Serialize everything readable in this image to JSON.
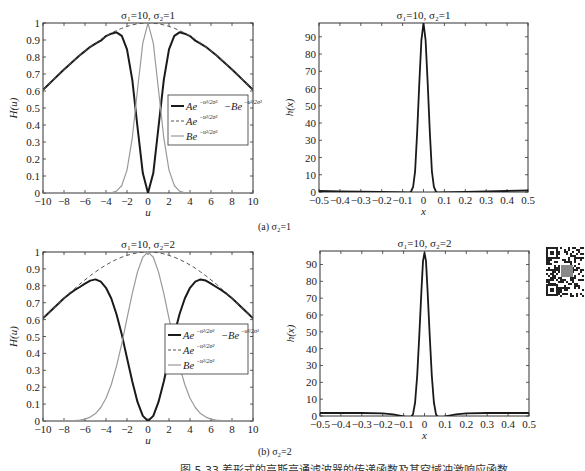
{
  "figure": {
    "caption": "图 5.33   差形式的高斯高通滤波器的传递函数及其空域冲激响应函数",
    "sub_captions": [
      {
        "label": "(a) σ₂=1"
      },
      {
        "label": "(b) σ₂=2"
      }
    ],
    "qr_code": {
      "present": true
    }
  },
  "chart_data": [
    {
      "id": "freq_a",
      "type": "line",
      "title": "σ₁=10, σ₂=1",
      "xlabel": "u",
      "ylabel": "H(u)",
      "xlim": [
        -10,
        10
      ],
      "ylim": [
        0,
        1
      ],
      "xticks": [
        -10,
        -8,
        -6,
        -4,
        -2,
        0,
        2,
        4,
        6,
        8,
        10
      ],
      "xtick_labels": [
        "−10",
        "−8",
        "−6",
        "−4",
        "−2",
        "0",
        "2",
        "4",
        "6",
        "8",
        "10"
      ],
      "yticks": [
        0,
        0.1,
        0.2,
        0.3,
        0.4,
        0.5,
        0.6,
        0.7,
        0.8,
        0.9,
        1
      ],
      "ytick_labels": [
        "0",
        "0.1",
        "0.2",
        "0.3",
        "0.4",
        "0.5",
        "0.6",
        "0.7",
        "0.8",
        "0.9",
        "1"
      ],
      "grid": false,
      "legend": {
        "position": "center-right",
        "entries": [
          "Ae^{-u²/2σ₁²} − Be^{-u²/2σ₂²}",
          "Ae^{-u²/2σ₁²}",
          "Be^{-u²/2σ₂²}"
        ]
      },
      "x": [
        -10,
        -9.5,
        -9,
        -8.5,
        -8,
        -7.5,
        -7,
        -6.5,
        -6,
        -5.5,
        -5,
        -4.5,
        -4,
        -3.5,
        -3,
        -2.5,
        -2,
        -1.5,
        -1,
        -0.5,
        0,
        0.5,
        1,
        1.5,
        2,
        2.5,
        3,
        3.5,
        4,
        4.5,
        5,
        5.5,
        6,
        6.5,
        7,
        7.5,
        8,
        8.5,
        9,
        9.5,
        10
      ],
      "series": [
        {
          "name": "Ae^{-u²/2σ₁²} − Be^{-u²/2σ₂²}",
          "style": "solid",
          "color": "#1a1a1a",
          "width": 2,
          "values": [
            0.607,
            0.637,
            0.667,
            0.697,
            0.726,
            0.755,
            0.783,
            0.81,
            0.835,
            0.86,
            0.879,
            0.896,
            0.923,
            0.937,
            0.945,
            0.925,
            0.845,
            0.665,
            0.388,
            0.117,
            0,
            0.117,
            0.388,
            0.665,
            0.845,
            0.925,
            0.945,
            0.937,
            0.923,
            0.896,
            0.879,
            0.86,
            0.835,
            0.81,
            0.783,
            0.755,
            0.726,
            0.697,
            0.667,
            0.637,
            0.607
          ]
        },
        {
          "name": "Ae^{-u²/2σ₁²}",
          "style": "dashed",
          "color": "#555555",
          "width": 1,
          "values": [
            0.607,
            0.637,
            0.667,
            0.697,
            0.726,
            0.755,
            0.783,
            0.81,
            0.835,
            0.86,
            0.882,
            0.904,
            0.923,
            0.941,
            0.956,
            0.969,
            0.98,
            0.989,
            0.995,
            0.999,
            1,
            0.999,
            0.995,
            0.989,
            0.98,
            0.969,
            0.956,
            0.941,
            0.923,
            0.904,
            0.882,
            0.86,
            0.835,
            0.81,
            0.783,
            0.755,
            0.726,
            0.697,
            0.667,
            0.637,
            0.607
          ]
        },
        {
          "name": "Be^{-u²/2σ₂²}",
          "style": "solid",
          "color": "#9a9a9a",
          "width": 1.2,
          "values": [
            0,
            0,
            0,
            0,
            0,
            0,
            0,
            0,
            0,
            0,
            0,
            0,
            0,
            0.002,
            0.011,
            0.044,
            0.135,
            0.325,
            0.607,
            0.882,
            1,
            0.882,
            0.607,
            0.325,
            0.135,
            0.044,
            0.011,
            0.002,
            0,
            0,
            0,
            0,
            0,
            0,
            0,
            0,
            0,
            0,
            0,
            0,
            0
          ]
        }
      ]
    },
    {
      "id": "spatial_a",
      "type": "line",
      "title": "σ₁=10, σ₂=1",
      "xlabel": "x",
      "ylabel": "h(x)",
      "xlim": [
        -0.5,
        0.5
      ],
      "ylim": [
        0,
        98
      ],
      "xticks": [
        -0.5,
        -0.4,
        -0.3,
        -0.2,
        -0.1,
        0,
        0.1,
        0.2,
        0.3,
        0.4,
        0.5
      ],
      "xtick_labels": [
        "−0.5",
        "−0.4",
        "−0.3",
        "−0.2",
        "−0.1",
        "0",
        "0.1",
        "0.2",
        "0.3",
        "0.4",
        "0.5"
      ],
      "yticks": [
        0,
        10,
        20,
        30,
        40,
        50,
        60,
        70,
        80,
        90
      ],
      "ytick_labels": [
        "0",
        "10",
        "20",
        "30",
        "40",
        "50",
        "60",
        "70",
        "80",
        "90"
      ],
      "grid": false,
      "x": [
        -0.5,
        -0.4,
        -0.3,
        -0.2,
        -0.1,
        -0.07,
        -0.06,
        -0.05,
        -0.04,
        -0.03,
        -0.02,
        -0.01,
        0,
        0.01,
        0.02,
        0.03,
        0.04,
        0.05,
        0.06,
        0.07,
        0.1,
        0.2,
        0.3,
        0.4,
        0.5
      ],
      "series": [
        {
          "name": "h(x)",
          "style": "solid",
          "color": "#1a1a1a",
          "width": 1.8,
          "values": [
            0.6,
            0.4,
            0.2,
            0,
            -0.2,
            -0.4,
            0.2,
            3,
            12,
            35,
            63,
            88,
            98,
            88,
            63,
            35,
            12,
            3,
            0.2,
            -0.4,
            -0.2,
            0,
            0.3,
            0.6,
            1
          ]
        }
      ]
    },
    {
      "id": "freq_b",
      "type": "line",
      "title": "σ₁=10, σ₂=2",
      "xlabel": "u",
      "ylabel": "H(u)",
      "xlim": [
        -10,
        10
      ],
      "ylim": [
        0,
        1
      ],
      "xticks": [
        -10,
        -8,
        -6,
        -4,
        -2,
        0,
        2,
        4,
        6,
        8,
        10
      ],
      "xtick_labels": [
        "−10",
        "−8",
        "−6",
        "−4",
        "−2",
        "0",
        "2",
        "4",
        "6",
        "8",
        "10"
      ],
      "yticks": [
        0,
        0.1,
        0.2,
        0.3,
        0.4,
        0.5,
        0.6,
        0.7,
        0.8,
        0.9,
        1
      ],
      "ytick_labels": [
        "0",
        "0.1",
        "0.2",
        "0.3",
        "0.4",
        "0.5",
        "0.6",
        "0.7",
        "0.8",
        "0.9",
        "1"
      ],
      "grid": false,
      "legend": {
        "position": "center-right",
        "entries": [
          "Ae^{-u²/2σ₁²} − Be^{-u²/2σ₂²}",
          "Ae^{-u²/2σ₁²}",
          "Be^{-u²/2σ₂²}"
        ]
      },
      "x": [
        -10,
        -9.5,
        -9,
        -8.5,
        -8,
        -7.5,
        -7,
        -6.5,
        -6,
        -5.5,
        -5,
        -4.5,
        -4,
        -3.5,
        -3,
        -2.5,
        -2,
        -1.5,
        -1,
        -0.5,
        0,
        0.5,
        1,
        1.5,
        2,
        2.5,
        3,
        3.5,
        4,
        4.5,
        5,
        5.5,
        6,
        6.5,
        7,
        7.5,
        8,
        8.5,
        9,
        9.5,
        10
      ],
      "series": [
        {
          "name": "Ae^{-u²/2σ₁²} − Be^{-u²/2σ₂²}",
          "style": "solid",
          "color": "#1a1a1a",
          "width": 2,
          "values": [
            0.607,
            0.637,
            0.667,
            0.697,
            0.726,
            0.752,
            0.774,
            0.793,
            0.813,
            0.831,
            0.838,
            0.824,
            0.788,
            0.725,
            0.632,
            0.511,
            0.373,
            0.234,
            0.113,
            0.03,
            0,
            0.03,
            0.113,
            0.234,
            0.373,
            0.511,
            0.632,
            0.725,
            0.788,
            0.824,
            0.838,
            0.831,
            0.813,
            0.793,
            0.774,
            0.752,
            0.726,
            0.697,
            0.667,
            0.637,
            0.607
          ]
        },
        {
          "name": "Ae^{-u²/2σ₁²}",
          "style": "dashed",
          "color": "#555555",
          "width": 1,
          "values": [
            0.607,
            0.637,
            0.667,
            0.697,
            0.726,
            0.755,
            0.783,
            0.81,
            0.835,
            0.86,
            0.882,
            0.904,
            0.923,
            0.941,
            0.956,
            0.969,
            0.98,
            0.989,
            0.995,
            0.999,
            1,
            0.999,
            0.995,
            0.989,
            0.98,
            0.969,
            0.956,
            0.941,
            0.923,
            0.904,
            0.882,
            0.86,
            0.835,
            0.81,
            0.783,
            0.755,
            0.726,
            0.697,
            0.667,
            0.637,
            0.607
          ]
        },
        {
          "name": "Be^{-u²/2σ₂²}",
          "style": "solid",
          "color": "#9a9a9a",
          "width": 1.2,
          "values": [
            0,
            0,
            0,
            0,
            0.0003,
            0.0009,
            0.0022,
            0.005,
            0.011,
            0.023,
            0.044,
            0.08,
            0.135,
            0.216,
            0.325,
            0.458,
            0.607,
            0.755,
            0.882,
            0.969,
            1,
            0.969,
            0.882,
            0.755,
            0.607,
            0.458,
            0.325,
            0.216,
            0.135,
            0.08,
            0.044,
            0.023,
            0.011,
            0.005,
            0.0022,
            0.0009,
            0.0003,
            0,
            0,
            0,
            0
          ]
        }
      ]
    },
    {
      "id": "spatial_b",
      "type": "line",
      "title": "σ₁=10, σ₂=2",
      "xlabel": "x",
      "ylabel": "h(x)",
      "xlim": [
        -0.5,
        0.5
      ],
      "ylim": [
        0,
        98
      ],
      "xticks": [
        -0.5,
        -0.4,
        -0.3,
        -0.2,
        -0.1,
        0,
        0.1,
        0.2,
        0.3,
        0.4,
        0.5
      ],
      "xtick_labels": [
        "−0.5",
        "−0.4",
        "−0.3",
        "−0.2",
        "−0.1",
        "0",
        "0.1",
        "0.2",
        "0.3",
        "0.4",
        "0.5"
      ],
      "yticks": [
        0,
        10,
        20,
        30,
        40,
        50,
        60,
        70,
        80,
        90
      ],
      "ytick_labels": [
        "0",
        "10",
        "20",
        "30",
        "40",
        "50",
        "60",
        "70",
        "80",
        "90"
      ],
      "grid": false,
      "x": [
        -0.5,
        -0.4,
        -0.3,
        -0.2,
        -0.15,
        -0.1,
        -0.08,
        -0.065,
        -0.055,
        -0.045,
        -0.035,
        -0.025,
        -0.015,
        -0.007,
        0,
        0.007,
        0.015,
        0.025,
        0.035,
        0.045,
        0.055,
        0.065,
        0.08,
        0.1,
        0.15,
        0.2,
        0.3,
        0.4,
        0.5
      ],
      "series": [
        {
          "name": "h(x)",
          "style": "solid",
          "color": "#1a1a1a",
          "width": 1.8,
          "values": [
            1.8,
            1.8,
            1.8,
            1.6,
            1,
            -0.2,
            -1,
            -0.8,
            1,
            8,
            24,
            48,
            74,
            92,
            97,
            92,
            74,
            48,
            24,
            8,
            1,
            -0.8,
            -1,
            -0.2,
            1,
            1.6,
            1.8,
            1.8,
            1.8
          ]
        }
      ]
    }
  ]
}
